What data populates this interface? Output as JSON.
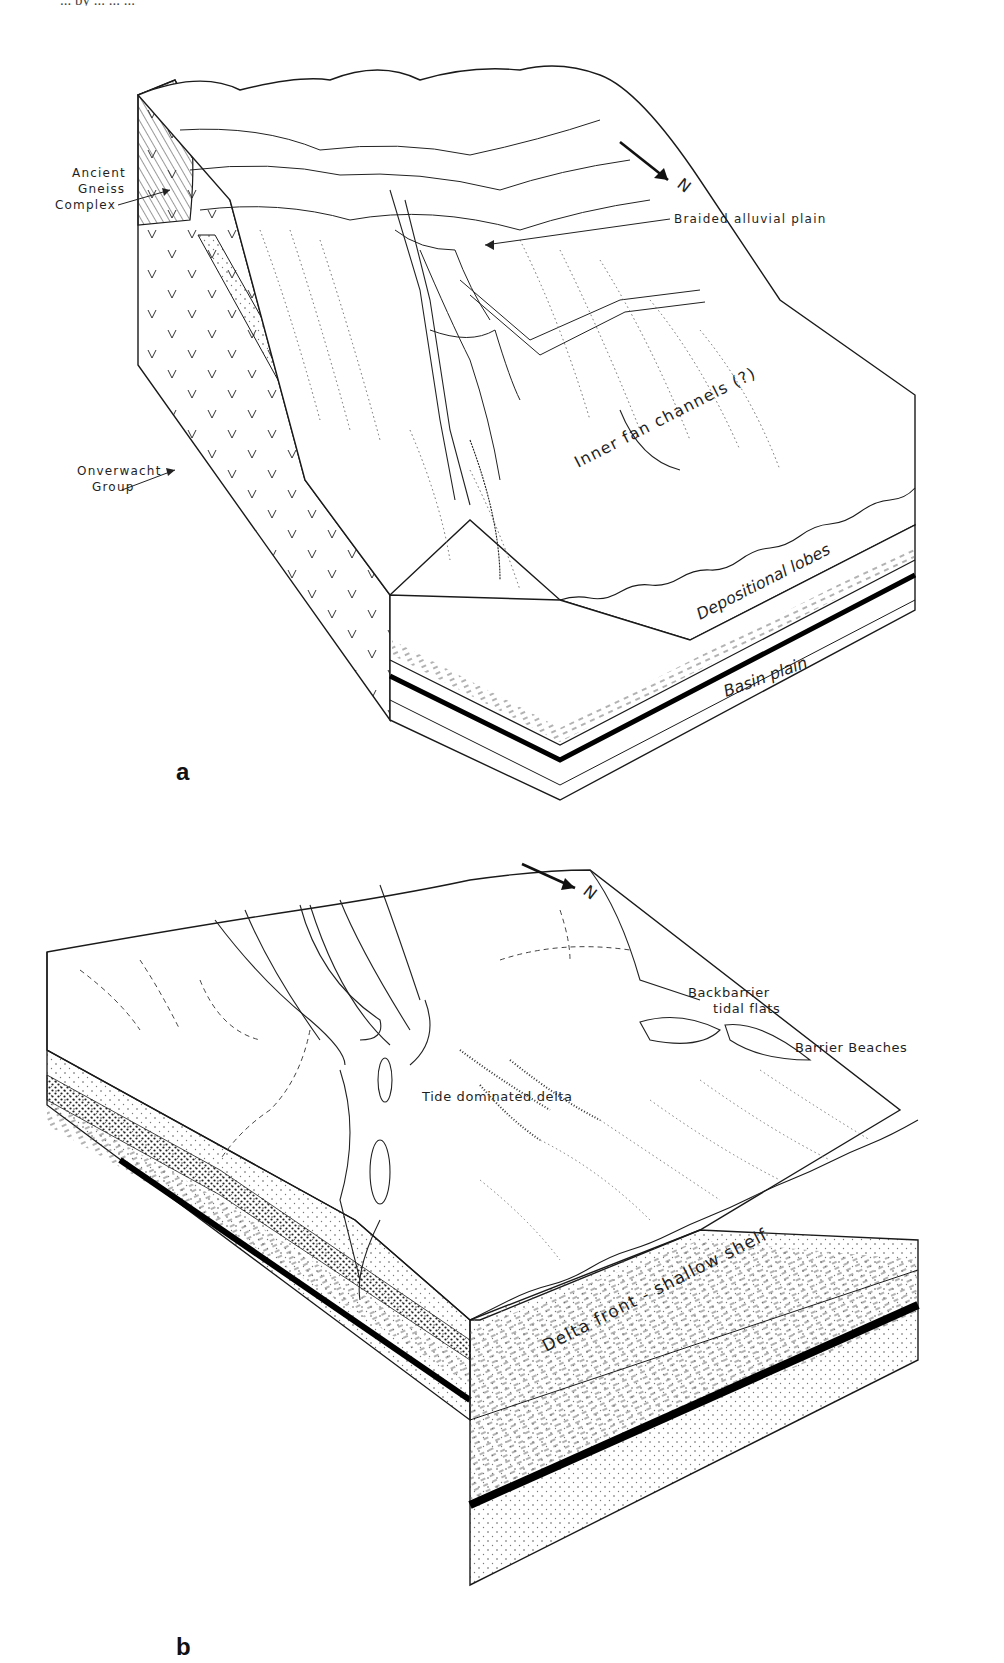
{
  "page": {
    "running_header_fragment": "... by ... ... ..."
  },
  "panels": [
    {
      "id": "a",
      "letter": "a",
      "title": "Block diagram a",
      "labels": {
        "ancient_gneiss": [
          "Ancient",
          "Gneiss",
          "Complex"
        ],
        "onverwacht": [
          "Onverwacht",
          "Group"
        ],
        "braided": "Braided alluvial plain",
        "inner_fan": "Inner fan channels (?)",
        "depositional": "Depositional lobes",
        "basin_plain": "Basin plain"
      },
      "north_arrow": "N"
    },
    {
      "id": "b",
      "letter": "b",
      "title": "Block diagram b",
      "labels": {
        "backbarrier": [
          "Backbarrier",
          "tidal flats"
        ],
        "barrier_beaches": "Barrier Beaches",
        "tide_delta": "Tide dominated delta",
        "delta_front": "Delta front - shallow shelf"
      },
      "north_arrow": "N"
    }
  ],
  "colors": {
    "ink": "#1a1a1a",
    "paper": "#ffffff",
    "stipple": "#555555"
  }
}
